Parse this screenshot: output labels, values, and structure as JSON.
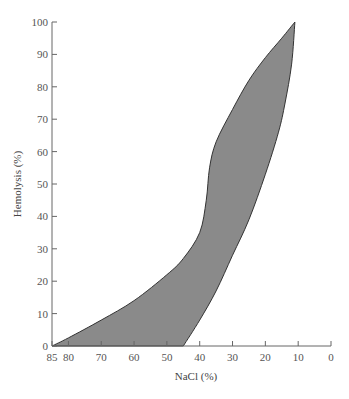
{
  "chart_data": {
    "type": "area",
    "title": "",
    "xlabel": "NaCl (%)",
    "ylabel": "Hemolysis (%)",
    "xlim": [
      85,
      0
    ],
    "ylim": [
      0,
      100
    ],
    "x_reversed": true,
    "grid": false,
    "x_ticks": [
      85,
      80,
      70,
      60,
      50,
      40,
      30,
      20,
      10,
      0
    ],
    "y_ticks": [
      0,
      10,
      20,
      30,
      40,
      50,
      60,
      70,
      80,
      90,
      100
    ],
    "fill_color": "#8a8a8a",
    "series": [
      {
        "name": "upper boundary",
        "x": [
          85,
          80,
          70,
          60,
          50,
          45,
          40,
          38,
          37,
          35,
          30,
          25,
          20,
          15,
          11
        ],
        "y": [
          0,
          2.5,
          8,
          14,
          22,
          27,
          35,
          45,
          55,
          63,
          73,
          82,
          89,
          95,
          100
        ]
      },
      {
        "name": "lower boundary",
        "x": [
          45,
          40,
          35,
          30,
          25,
          20,
          16,
          14,
          12,
          11
        ],
        "y": [
          0,
          8,
          17,
          28,
          39,
          53,
          66,
          75,
          87,
          100
        ]
      }
    ]
  }
}
